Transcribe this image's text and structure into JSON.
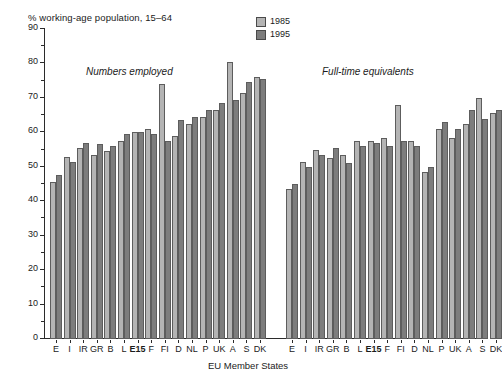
{
  "chart_data": {
    "type": "bar",
    "title": "% working-age population, 15–64",
    "xlabel": "EU Member States",
    "ylabel": "% working-age population, 15–64",
    "ylim": [
      0,
      90
    ],
    "ytick_step": 10,
    "grid": false,
    "legend_position": "top-right",
    "legend": [
      "1985",
      "1995"
    ],
    "panels": [
      {
        "caption": "Numbers employed",
        "categories": [
          "E",
          "I",
          "IR",
          "GR",
          "B",
          "L",
          "E15",
          "F",
          "FI",
          "D",
          "NL",
          "P",
          "UK",
          "A",
          "S",
          "DK"
        ],
        "series": [
          {
            "name": "1985",
            "values": [
              45.5,
              52.8,
              55.5,
              53.5,
              54.5,
              57.5,
              60.0,
              61.0,
              74.0,
              59.0,
              62.5,
              64.5,
              66.5,
              80.5,
              71.5,
              76.0
            ]
          },
          {
            "name": "1995",
            "values": [
              47.5,
              51.5,
              57.0,
              56.5,
              56.0,
              59.5,
              60.0,
              59.5,
              57.5,
              63.5,
              64.5,
              66.5,
              68.5,
              69.5,
              74.5,
              75.5
            ]
          }
        ]
      },
      {
        "caption": "Full-time equivalents",
        "categories": [
          "E",
          "I",
          "IR",
          "GR",
          "B",
          "L",
          "E15",
          "F",
          "FI",
          "D",
          "NL",
          "P",
          "UK",
          "A",
          "S",
          "DK"
        ],
        "series": [
          {
            "name": "1985",
            "values": [
              43.5,
              51.5,
              55.0,
              52.5,
              53.5,
              57.5,
              57.5,
              58.5,
              68.0,
              57.5,
              48.5,
              61.0,
              58.5,
              62.5,
              70.0,
              65.5
            ]
          },
          {
            "name": "1995",
            "values": [
              45.0,
              50.0,
              53.5,
              55.5,
              51.0,
              56.0,
              57.0,
              56.0,
              57.5,
              56.0,
              50.0,
              63.0,
              61.0,
              66.5,
              64.0,
              66.5
            ]
          }
        ]
      }
    ],
    "colors": {
      "series_1985": "#b4b4b4",
      "series_1995": "#7d7d7d",
      "axis": "#2b2b2b",
      "background": "#ffffff"
    }
  }
}
